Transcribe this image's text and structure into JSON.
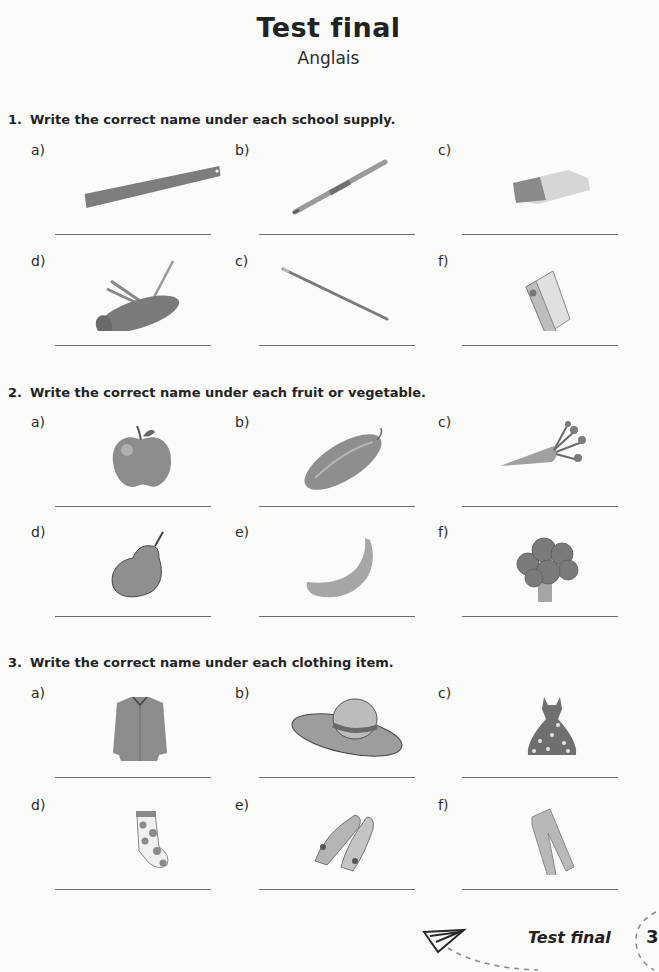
{
  "header": {
    "title": "Test final",
    "subtitle": "Anglais"
  },
  "sections": [
    {
      "number": "1.",
      "instruction": "Write the correct name under each school supply.",
      "items": [
        {
          "label": "a)",
          "icon": "ruler-icon",
          "answer": ""
        },
        {
          "label": "b)",
          "icon": "pen-icon",
          "answer": ""
        },
        {
          "label": "c)",
          "icon": "eraser-icon",
          "answer": ""
        },
        {
          "label": "d)",
          "icon": "pencil-case-icon",
          "answer": ""
        },
        {
          "label": "c)",
          "icon": "pencil-icon",
          "answer": ""
        },
        {
          "label": "f)",
          "icon": "binder-icon",
          "answer": ""
        }
      ]
    },
    {
      "number": "2.",
      "instruction": "Write the correct name under each fruit or vegetable.",
      "items": [
        {
          "label": "a)",
          "icon": "apple-icon",
          "answer": ""
        },
        {
          "label": "b)",
          "icon": "cucumber-icon",
          "answer": ""
        },
        {
          "label": "c)",
          "icon": "carrot-icon",
          "answer": ""
        },
        {
          "label": "d)",
          "icon": "pear-icon",
          "answer": ""
        },
        {
          "label": "e)",
          "icon": "banana-icon",
          "answer": ""
        },
        {
          "label": "f)",
          "icon": "broccoli-icon",
          "answer": ""
        }
      ]
    },
    {
      "number": "3.",
      "instruction": "Write the correct name under each clothing item.",
      "items": [
        {
          "label": "a)",
          "icon": "shirt-icon",
          "answer": ""
        },
        {
          "label": "b)",
          "icon": "hat-icon",
          "answer": ""
        },
        {
          "label": "c)",
          "icon": "dress-icon",
          "answer": ""
        },
        {
          "label": "d)",
          "icon": "sock-icon",
          "answer": ""
        },
        {
          "label": "e)",
          "icon": "shoes-icon",
          "answer": ""
        },
        {
          "label": "f)",
          "icon": "pants-icon",
          "answer": ""
        }
      ]
    }
  ],
  "footer": {
    "title": "Test final",
    "page_number": "3",
    "icon": "paper-plane-icon"
  },
  "colors": {
    "text": "#222222",
    "line": "#6d6d6d",
    "image_gray": "#8a8a8a"
  }
}
